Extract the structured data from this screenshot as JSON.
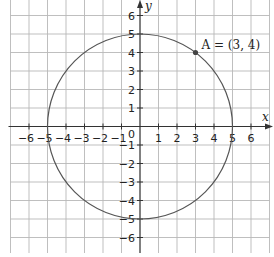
{
  "chart_data": {
    "type": "scatter",
    "title": "",
    "xlabel": "x",
    "ylabel": "y",
    "xlim": [
      -7,
      7
    ],
    "ylim": [
      -7,
      7
    ],
    "grid": true,
    "x_ticks": [
      -6,
      -5,
      -4,
      -3,
      -2,
      -1,
      1,
      2,
      3,
      4,
      5,
      6
    ],
    "y_ticks": [
      6,
      5,
      4,
      3,
      2,
      1,
      -1,
      -2,
      -3,
      -4,
      -5,
      -6
    ],
    "origin_label": "0",
    "curves": [
      {
        "name": "circle",
        "shape": "circle",
        "center": [
          0,
          0
        ],
        "radius": 5,
        "equation": "x^2 + y^2 = 25"
      }
    ],
    "points": [
      {
        "name": "A",
        "x": 3,
        "y": 4,
        "label": "A = (3, 4)"
      }
    ],
    "legend": null
  },
  "labels": {
    "x_axis": "x",
    "y_axis": "y",
    "origin": "0",
    "point_a": "A = (3, 4)"
  },
  "colors": {
    "grid": "#b8b8b8",
    "axis": "#333333",
    "curve": "#555555",
    "point": "#444444"
  }
}
